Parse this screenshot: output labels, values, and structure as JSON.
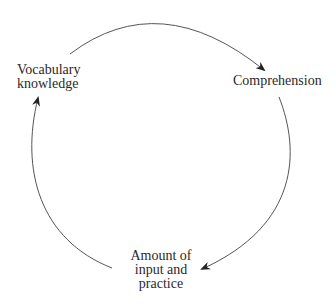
{
  "diagram": {
    "type": "cycle",
    "nodes": [
      {
        "id": "vocab",
        "lines": [
          "Vocabulary",
          "knowledge"
        ]
      },
      {
        "id": "comp",
        "lines": [
          "Comprehension"
        ]
      },
      {
        "id": "amount",
        "lines": [
          "Amount of",
          "input and",
          "practice"
        ]
      }
    ],
    "edges": [
      {
        "from": "vocab",
        "to": "comp"
      },
      {
        "from": "comp",
        "to": "amount"
      },
      {
        "from": "amount",
        "to": "vocab"
      }
    ],
    "colors": {
      "line": "#555555",
      "text": "#2a2a2a",
      "background": "#ffffff"
    }
  }
}
